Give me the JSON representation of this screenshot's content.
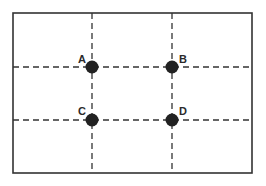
{
  "diagram": {
    "type": "rule-of-thirds-grid",
    "frame": {
      "x": 13,
      "y": 13,
      "width": 239,
      "height": 160,
      "stroke": "#333333"
    },
    "grid_lines": {
      "vertical_x": [
        92,
        172
      ],
      "horizontal_y": [
        67,
        120
      ],
      "stroke": "#333333",
      "dash": "6,4"
    },
    "points": [
      {
        "label": "A",
        "x": 92,
        "y": 67,
        "label_dx": -14,
        "label_dy": -4
      },
      {
        "label": "B",
        "x": 172,
        "y": 67,
        "label_dx": 7,
        "label_dy": -4
      },
      {
        "label": "C",
        "x": 92,
        "y": 120,
        "label_dx": -14,
        "label_dy": -5
      },
      {
        "label": "D",
        "x": 172,
        "y": 120,
        "label_dx": 7,
        "label_dy": -5
      }
    ],
    "point_color": "#222222",
    "point_radius": 6.5
  }
}
